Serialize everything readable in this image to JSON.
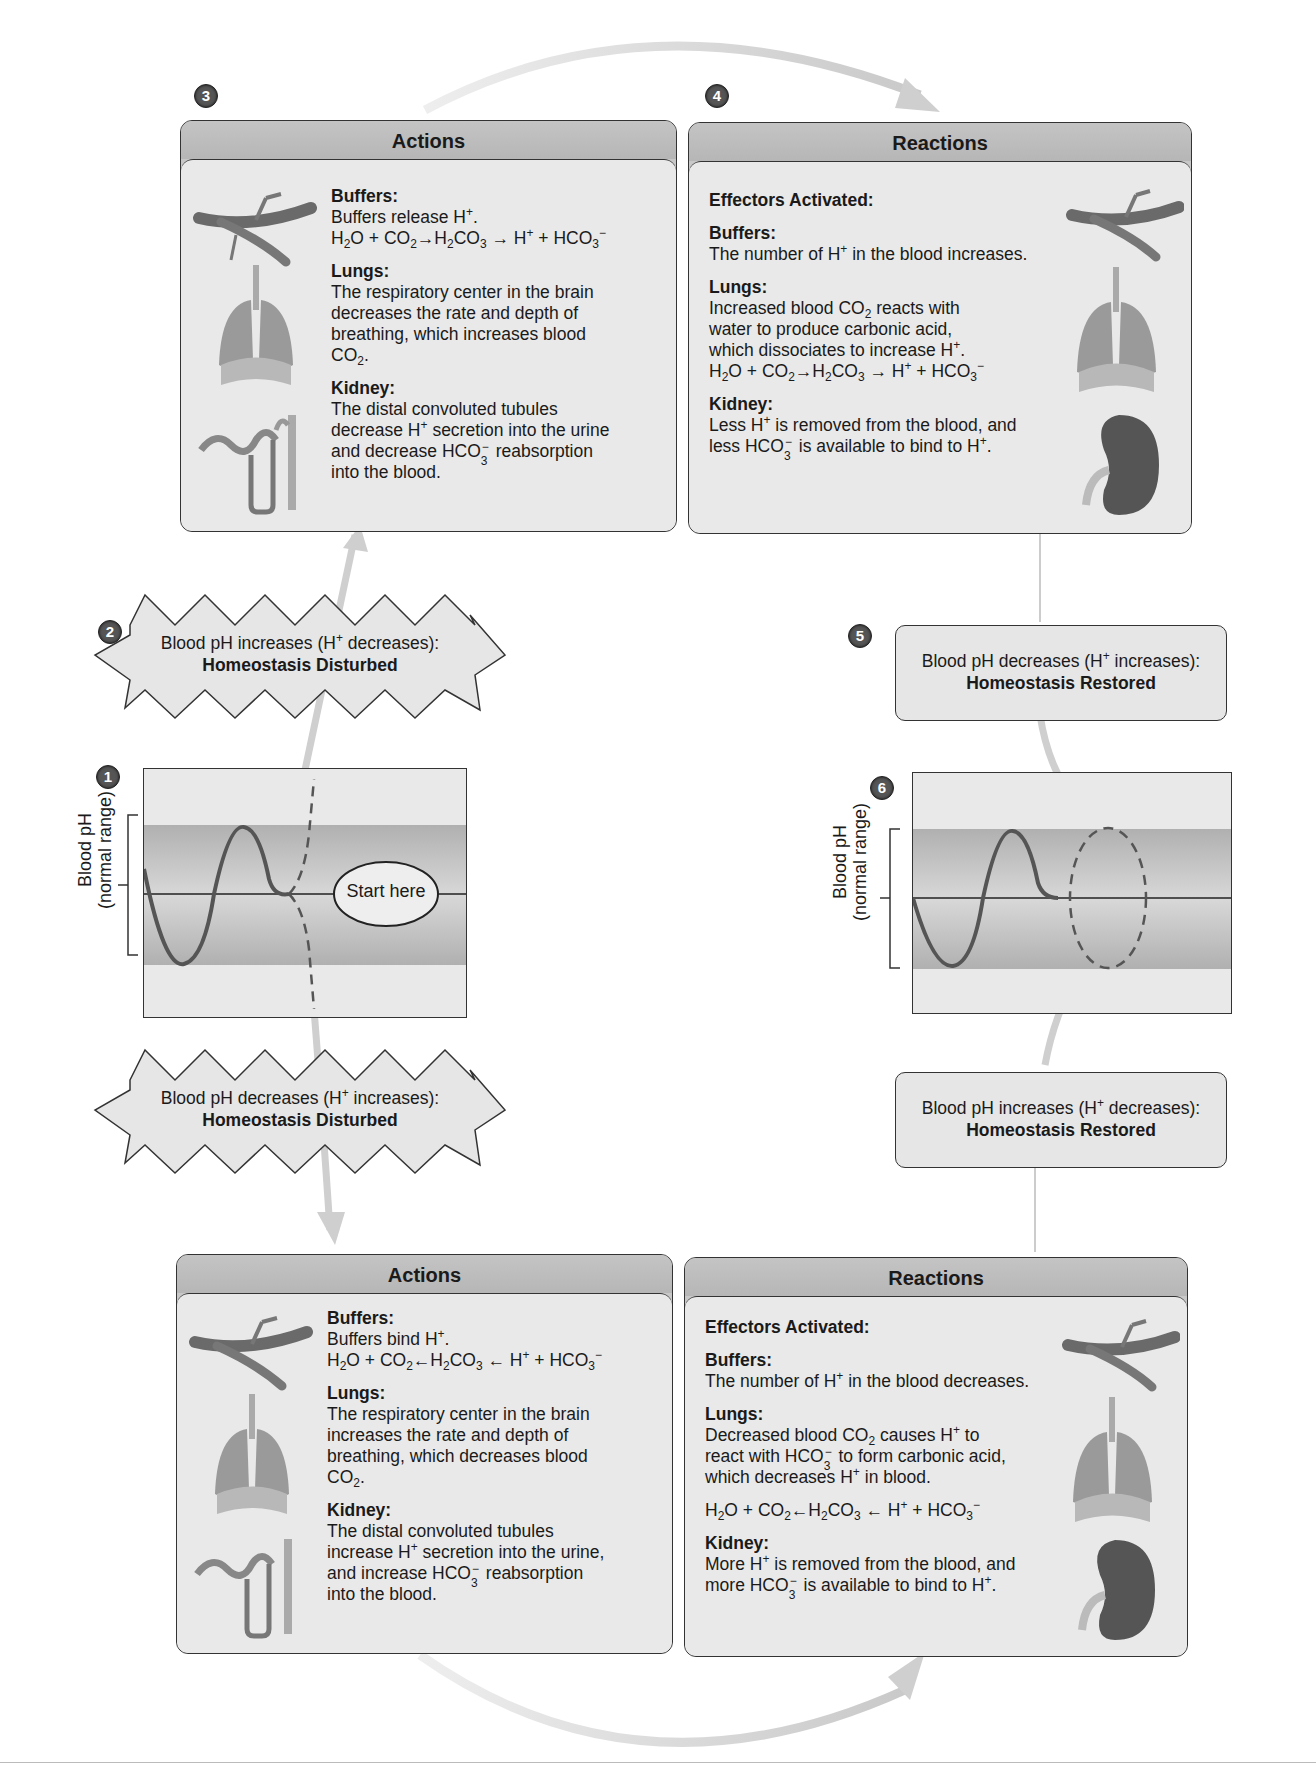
{
  "steps": {
    "s1": "1",
    "s2": "2",
    "s3": "3",
    "s4": "4",
    "s5": "5",
    "s6": "6"
  },
  "top_actions": {
    "title": "Actions",
    "lines": [
      {
        "type": "h",
        "text": "Buffers:"
      },
      {
        "type": "l",
        "segs": [
          [
            "t",
            "Buffers release H"
          ],
          [
            "sup",
            "+"
          ],
          [
            "t",
            "."
          ]
        ]
      },
      {
        "type": "l",
        "segs": [
          [
            "t",
            "H"
          ],
          [
            "sub",
            "2"
          ],
          [
            "t",
            "O + CO"
          ],
          [
            "sub",
            "2"
          ],
          [
            "t",
            "→H"
          ],
          [
            "sub",
            "2"
          ],
          [
            "t",
            "CO"
          ],
          [
            "sub",
            "3"
          ],
          [
            "t",
            " → H"
          ],
          [
            "sup",
            "+"
          ],
          [
            "t",
            " + HCO"
          ],
          [
            "sub",
            "3"
          ],
          [
            "sup",
            "−"
          ]
        ]
      },
      {
        "type": "gap"
      },
      {
        "type": "h",
        "text": "Lungs:"
      },
      {
        "type": "l",
        "segs": [
          [
            "t",
            "The respiratory center in the brain"
          ]
        ]
      },
      {
        "type": "l",
        "segs": [
          [
            "t",
            "decreases the rate and depth of"
          ]
        ]
      },
      {
        "type": "l",
        "segs": [
          [
            "t",
            "breathing, which increases blood"
          ]
        ]
      },
      {
        "type": "l",
        "segs": [
          [
            "t",
            "CO"
          ],
          [
            "sub",
            "2"
          ],
          [
            "t",
            "."
          ]
        ]
      },
      {
        "type": "gap"
      },
      {
        "type": "h",
        "text": "Kidney:"
      },
      {
        "type": "l",
        "segs": [
          [
            "t",
            "The distal convoluted tubules"
          ]
        ]
      },
      {
        "type": "l",
        "segs": [
          [
            "t",
            "decrease H"
          ],
          [
            "sup",
            "+"
          ],
          [
            "t",
            " secretion into the urine"
          ]
        ]
      },
      {
        "type": "l",
        "segs": [
          [
            "t",
            "and decrease HCO"
          ],
          [
            "ss",
            "3",
            "−"
          ],
          [
            "t",
            " reabsorption"
          ]
        ]
      },
      {
        "type": "l",
        "segs": [
          [
            "t",
            "into the blood."
          ]
        ]
      }
    ]
  },
  "top_reactions": {
    "title": "Reactions",
    "lines": [
      {
        "type": "h",
        "text": "Effectors Activated:"
      },
      {
        "type": "gap"
      },
      {
        "type": "h",
        "text": "Buffers:"
      },
      {
        "type": "l",
        "segs": [
          [
            "t",
            "The number of H"
          ],
          [
            "sup",
            "+"
          ],
          [
            "t",
            " in the blood increases."
          ]
        ]
      },
      {
        "type": "gap"
      },
      {
        "type": "h",
        "text": "Lungs:"
      },
      {
        "type": "l",
        "segs": [
          [
            "t",
            "Increased blood CO"
          ],
          [
            "sub",
            "2"
          ],
          [
            "t",
            " reacts with"
          ]
        ]
      },
      {
        "type": "l",
        "segs": [
          [
            "t",
            "water to produce carbonic acid,"
          ]
        ]
      },
      {
        "type": "l",
        "segs": [
          [
            "t",
            "which dissociates to increase H"
          ],
          [
            "sup",
            "+"
          ],
          [
            "t",
            "."
          ]
        ]
      },
      {
        "type": "l",
        "segs": [
          [
            "t",
            "H"
          ],
          [
            "sub",
            "2"
          ],
          [
            "t",
            "O + CO"
          ],
          [
            "sub",
            "2"
          ],
          [
            "t",
            "→H"
          ],
          [
            "sub",
            "2"
          ],
          [
            "t",
            "CO"
          ],
          [
            "sub",
            "3"
          ],
          [
            "t",
            " → H"
          ],
          [
            "sup",
            "+"
          ],
          [
            "t",
            " + HCO"
          ],
          [
            "sub",
            "3"
          ],
          [
            "sup",
            "−"
          ]
        ]
      },
      {
        "type": "gap"
      },
      {
        "type": "h",
        "text": "Kidney:"
      },
      {
        "type": "l",
        "segs": [
          [
            "t",
            "Less H"
          ],
          [
            "sup",
            "+"
          ],
          [
            "t",
            " is removed from the blood, and"
          ]
        ]
      },
      {
        "type": "l",
        "segs": [
          [
            "t",
            "less HCO"
          ],
          [
            "ss",
            "3",
            "−"
          ],
          [
            "t",
            " is available to bind to H"
          ],
          [
            "sup",
            "+"
          ],
          [
            "t",
            "."
          ]
        ]
      }
    ]
  },
  "bottom_actions": {
    "title": "Actions",
    "lines": [
      {
        "type": "h",
        "text": "Buffers:"
      },
      {
        "type": "l",
        "segs": [
          [
            "t",
            "Buffers bind H"
          ],
          [
            "sup",
            "+"
          ],
          [
            "t",
            "."
          ]
        ]
      },
      {
        "type": "l",
        "segs": [
          [
            "t",
            "H"
          ],
          [
            "sub",
            "2"
          ],
          [
            "t",
            "O + CO"
          ],
          [
            "sub",
            "2"
          ],
          [
            "t",
            "←H"
          ],
          [
            "sub",
            "2"
          ],
          [
            "t",
            "CO"
          ],
          [
            "sub",
            "3"
          ],
          [
            "t",
            " ← H"
          ],
          [
            "sup",
            "+"
          ],
          [
            "t",
            " + HCO"
          ],
          [
            "sub",
            "3"
          ],
          [
            "sup",
            "−"
          ]
        ]
      },
      {
        "type": "gap"
      },
      {
        "type": "h",
        "text": "Lungs:"
      },
      {
        "type": "l",
        "segs": [
          [
            "t",
            "The respiratory center in the brain"
          ]
        ]
      },
      {
        "type": "l",
        "segs": [
          [
            "t",
            "increases the rate and depth of"
          ]
        ]
      },
      {
        "type": "l",
        "segs": [
          [
            "t",
            "breathing, which decreases blood"
          ]
        ]
      },
      {
        "type": "l",
        "segs": [
          [
            "t",
            "CO"
          ],
          [
            "sub",
            "2"
          ],
          [
            "t",
            "."
          ]
        ]
      },
      {
        "type": "gap"
      },
      {
        "type": "h",
        "text": "Kidney:"
      },
      {
        "type": "l",
        "segs": [
          [
            "t",
            "The distal convoluted tubules"
          ]
        ]
      },
      {
        "type": "l",
        "segs": [
          [
            "t",
            "increase H"
          ],
          [
            "sup",
            "+"
          ],
          [
            "t",
            " secretion into the urine,"
          ]
        ]
      },
      {
        "type": "l",
        "segs": [
          [
            "t",
            "and increase HCO"
          ],
          [
            "ss",
            "3",
            "−"
          ],
          [
            "t",
            " reabsorption"
          ]
        ]
      },
      {
        "type": "l",
        "segs": [
          [
            "t",
            "into the blood."
          ]
        ]
      }
    ]
  },
  "bottom_reactions": {
    "title": "Reactions",
    "lines": [
      {
        "type": "h",
        "text": "Effectors Activated:"
      },
      {
        "type": "gap"
      },
      {
        "type": "h",
        "text": "Buffers:"
      },
      {
        "type": "l",
        "segs": [
          [
            "t",
            "The number of H"
          ],
          [
            "sup",
            "+"
          ],
          [
            "t",
            " in the blood decreases."
          ]
        ]
      },
      {
        "type": "gap"
      },
      {
        "type": "h",
        "text": "Lungs:"
      },
      {
        "type": "l",
        "segs": [
          [
            "t",
            "Decreased blood CO"
          ],
          [
            "sub",
            "2"
          ],
          [
            "t",
            " causes H"
          ],
          [
            "sup",
            "+"
          ],
          [
            "t",
            " to"
          ]
        ]
      },
      {
        "type": "l",
        "segs": [
          [
            "t",
            "react with HCO"
          ],
          [
            "ss",
            "3",
            "−"
          ],
          [
            "t",
            " to form carbonic acid,"
          ]
        ]
      },
      {
        "type": "l",
        "segs": [
          [
            "t",
            "which decreases H"
          ],
          [
            "sup",
            "+"
          ],
          [
            "t",
            " in blood."
          ]
        ]
      },
      {
        "type": "gap"
      },
      {
        "type": "l",
        "segs": [
          [
            "t",
            "H"
          ],
          [
            "sub",
            "2"
          ],
          [
            "t",
            "O + CO"
          ],
          [
            "sub",
            "2"
          ],
          [
            "t",
            "←H"
          ],
          [
            "sub",
            "2"
          ],
          [
            "t",
            "CO"
          ],
          [
            "sub",
            "3"
          ],
          [
            "t",
            " ← H"
          ],
          [
            "sup",
            "+"
          ],
          [
            "t",
            " + HCO"
          ],
          [
            "sub",
            "3"
          ],
          [
            "sup",
            "−"
          ]
        ]
      },
      {
        "type": "gap"
      },
      {
        "type": "h",
        "text": "Kidney:"
      },
      {
        "type": "l",
        "segs": [
          [
            "t",
            "More H"
          ],
          [
            "sup",
            "+"
          ],
          [
            "t",
            " is removed from the blood, and"
          ]
        ]
      },
      {
        "type": "l",
        "segs": [
          [
            "t",
            "more HCO"
          ],
          [
            "ss",
            "3",
            "−"
          ],
          [
            "t",
            " is available to bind to H"
          ],
          [
            "sup",
            "+"
          ],
          [
            "t",
            "."
          ]
        ]
      }
    ]
  },
  "disturbed_up": {
    "line1_pre": "Blood pH increases (H",
    "line1_sup": "+",
    "line1_post": " decreases):",
    "line2": "Homeostasis Disturbed"
  },
  "disturbed_down": {
    "line1_pre": "Blood pH decreases (H",
    "line1_sup": "+",
    "line1_post": " increases):",
    "line2": "Homeostasis Disturbed"
  },
  "restored_down": {
    "line1_pre": "Blood pH decreases (H",
    "line1_sup": "+",
    "line1_post": " increases):",
    "line2": "Homeostasis Restored"
  },
  "restored_up": {
    "line1_pre": "Blood pH increases (H",
    "line1_sup": "+",
    "line1_post": " decreases):",
    "line2": "Homeostasis Restored"
  },
  "graph_left": {
    "ylabel1": "Blood pH",
    "ylabel2": "(normal range)",
    "start_label": "Start here"
  },
  "graph_right": {
    "ylabel1": "Blood pH",
    "ylabel2": "(normal range)"
  },
  "colors": {
    "panel_header": "#bdbdbd",
    "panel_body": "#e9e9e9",
    "band": "#b5b5b5",
    "arrow": "#d0d0d0",
    "step_circle": "#555555"
  }
}
